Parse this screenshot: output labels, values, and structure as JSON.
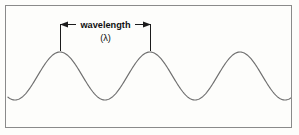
{
  "figure": {
    "kind": "wavelength-diagram",
    "background_color": "#fdfdfb",
    "frame_color": "#8a8a8a",
    "wave_color": "#6f6f6f",
    "annotation_color": "#1b1b1b",
    "width": 299,
    "height": 135
  },
  "annotation": {
    "label": "wavelength",
    "symbol": "(λ)",
    "left_arrow_icon": "arrow-left-icon",
    "right_arrow_icon": "arrow-right-icon",
    "dimension_y": 24,
    "left_marker_x": 60,
    "right_marker_x": 150
  },
  "chart_data": {
    "type": "line",
    "title": "",
    "subtitle": "",
    "xlabel": "",
    "ylabel": "",
    "legend": [],
    "grid": false,
    "xlim": [
      0,
      299
    ],
    "ylim": [
      135,
      0
    ],
    "annotations": [
      {
        "text": "wavelength",
        "x": 105,
        "y": 24
      },
      {
        "text": "(λ)",
        "x": 105,
        "y": 37
      }
    ],
    "waveform": {
      "shape": "sine",
      "crest_y": 52,
      "trough_y": 100,
      "amplitude": 24,
      "midline_y": 76,
      "wavelength_px": 90,
      "crest_x_positions": [
        60,
        150,
        240
      ],
      "trough_x_positions": [
        15,
        105,
        195,
        285
      ],
      "x_start": 8,
      "x_end": 292,
      "cycles_visible": 3
    },
    "measurement": {
      "quantity": "wavelength",
      "symbol": "λ",
      "span_from_x": 60,
      "span_to_x": 150,
      "span_px": 90
    }
  }
}
